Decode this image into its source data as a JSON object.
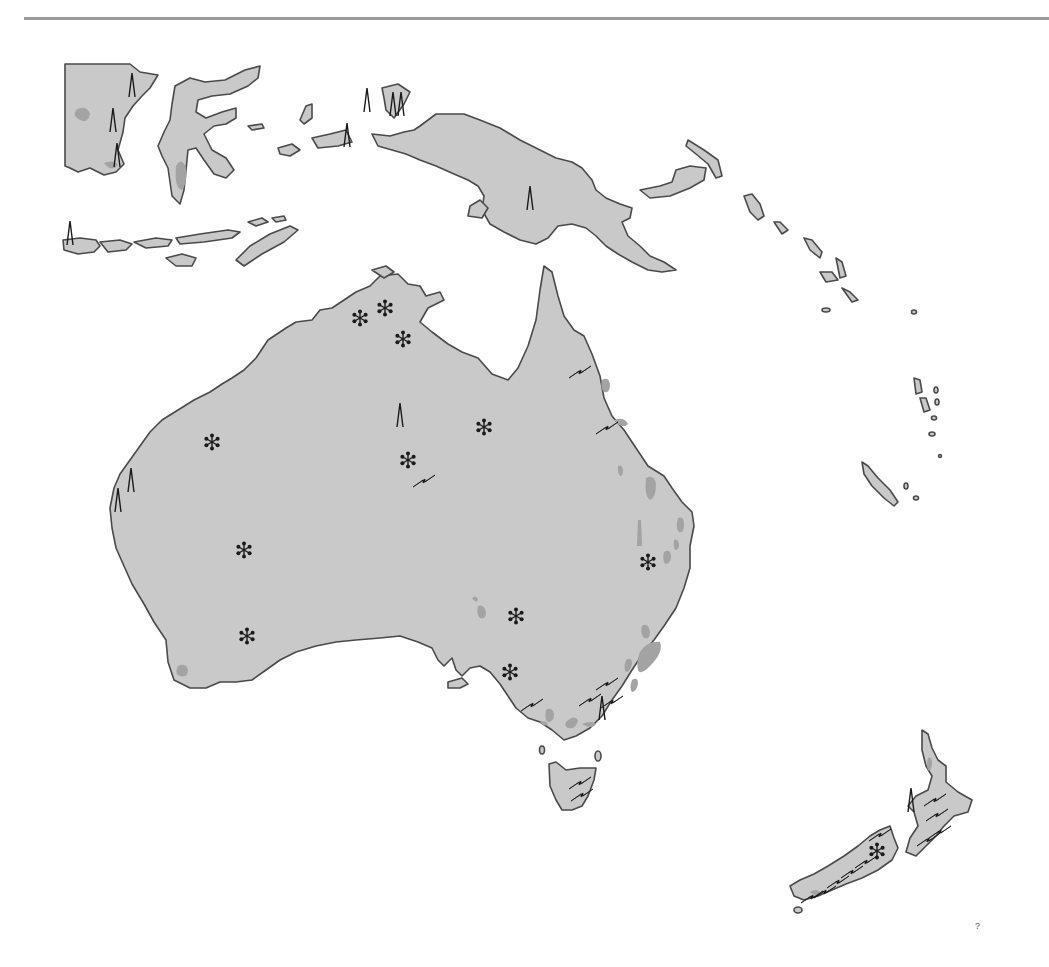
{
  "map": {
    "region": "Australia and Oceania",
    "colors": {
      "background": "#ffffff",
      "land": "#c9c9c9",
      "coastline": "#4a4a4a",
      "highlight_patch": "#a3a3a3",
      "symbol": "#1a1a1a",
      "top_rule": "#9a9a9a"
    },
    "legend_symbols": {
      "asterisk": "mineral-deposit-icon",
      "derrick": "oil-derrick-icon",
      "lightning": "hydroelectric-bolt-icon"
    },
    "corner_mark": "?",
    "landmasses": [
      {
        "name": "Australia"
      },
      {
        "name": "New Guinea"
      },
      {
        "name": "Borneo (part)"
      },
      {
        "name": "Sulawesi"
      },
      {
        "name": "Lesser Sunda Islands"
      },
      {
        "name": "Solomon Islands"
      },
      {
        "name": "Vanuatu"
      },
      {
        "name": "New Caledonia"
      },
      {
        "name": "Tasmania"
      },
      {
        "name": "New Zealand North Island"
      },
      {
        "name": "New Zealand South Island"
      }
    ],
    "asterisks": [
      {
        "x": 360,
        "y": 318
      },
      {
        "x": 385,
        "y": 308
      },
      {
        "x": 403,
        "y": 339
      },
      {
        "x": 484,
        "y": 427
      },
      {
        "x": 408,
        "y": 460
      },
      {
        "x": 212,
        "y": 442
      },
      {
        "x": 244,
        "y": 550
      },
      {
        "x": 247,
        "y": 636
      },
      {
        "x": 516,
        "y": 616
      },
      {
        "x": 510,
        "y": 672
      },
      {
        "x": 648,
        "y": 562
      },
      {
        "x": 877,
        "y": 851
      }
    ],
    "derricks": [
      {
        "x": 132,
        "y": 85
      },
      {
        "x": 113,
        "y": 120
      },
      {
        "x": 117,
        "y": 155
      },
      {
        "x": 70,
        "y": 233
      },
      {
        "x": 367,
        "y": 100
      },
      {
        "x": 393,
        "y": 104
      },
      {
        "x": 401,
        "y": 104
      },
      {
        "x": 347,
        "y": 135
      },
      {
        "x": 530,
        "y": 198
      },
      {
        "x": 400,
        "y": 415
      },
      {
        "x": 131,
        "y": 480
      },
      {
        "x": 118,
        "y": 500
      },
      {
        "x": 602,
        "y": 708
      },
      {
        "x": 911,
        "y": 800
      }
    ],
    "bolts": [
      {
        "x": 580,
        "y": 372
      },
      {
        "x": 607,
        "y": 428
      },
      {
        "x": 424,
        "y": 481
      },
      {
        "x": 532,
        "y": 705
      },
      {
        "x": 607,
        "y": 684
      },
      {
        "x": 590,
        "y": 700
      },
      {
        "x": 612,
        "y": 702
      },
      {
        "x": 580,
        "y": 783
      },
      {
        "x": 582,
        "y": 795
      },
      {
        "x": 935,
        "y": 800
      },
      {
        "x": 937,
        "y": 815
      },
      {
        "x": 940,
        "y": 832
      },
      {
        "x": 928,
        "y": 840
      },
      {
        "x": 880,
        "y": 835
      },
      {
        "x": 866,
        "y": 862
      },
      {
        "x": 852,
        "y": 872
      },
      {
        "x": 838,
        "y": 882
      },
      {
        "x": 825,
        "y": 892
      },
      {
        "x": 812,
        "y": 897
      }
    ]
  }
}
